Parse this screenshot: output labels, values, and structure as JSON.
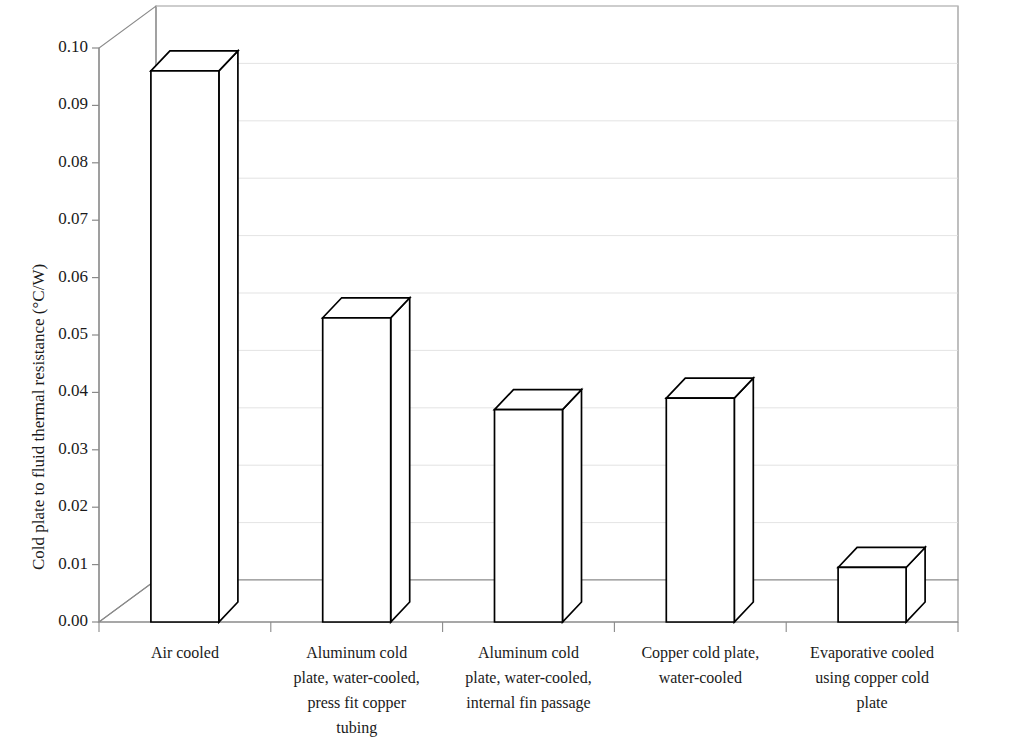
{
  "chart_data": {
    "type": "bar",
    "title": "",
    "xlabel": "",
    "ylabel": "Cold plate to fluid thermal resistance (°C/W)",
    "categories": [
      "Air cooled",
      "Aluminum cold plate, water-cooled, press fit copper tubing",
      "Aluminum cold plate, water-cooled, internal fin passage",
      "Copper cold plate, water-cooled",
      "Evaporative cooled using copper cold plate"
    ],
    "values": [
      0.096,
      0.053,
      0.037,
      0.039,
      0.0095
    ],
    "ylim": [
      0.0,
      0.1
    ],
    "ytick_values": [
      0.0,
      0.01,
      0.02,
      0.03,
      0.04,
      0.05,
      0.06,
      0.07,
      0.08,
      0.09,
      0.1
    ],
    "ytick_labels": [
      "0.00",
      "0.01",
      "0.02",
      "0.03",
      "0.04",
      "0.05",
      "0.06",
      "0.07",
      "0.08",
      "0.09",
      "0.10"
    ],
    "grid": false,
    "legend": null,
    "style": "3d-column",
    "bar_face_color": "#ffffff",
    "bar_edge_color": "#000000",
    "axis_color": "#8a8a8a",
    "text_color": "#1a1a1a"
  },
  "category_label_lines": [
    [
      "Air cooled"
    ],
    [
      "Aluminum cold",
      "plate, water-cooled,",
      "press fit copper",
      "tubing"
    ],
    [
      "Aluminum cold",
      "plate, water-cooled,",
      "internal fin passage"
    ],
    [
      "Copper cold plate,",
      "water-cooled"
    ],
    [
      "Evaporative cooled",
      "using copper cold",
      "plate"
    ]
  ]
}
